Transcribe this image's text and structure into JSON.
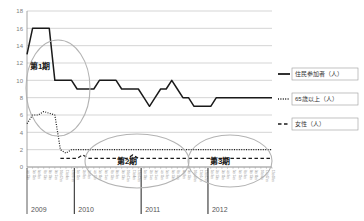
{
  "chart_data": {
    "type": "line",
    "title": "",
    "xlabel": "",
    "ylabel": "",
    "ylim": [
      0,
      18
    ],
    "yticks": [
      0,
      2,
      4,
      6,
      8,
      10,
      12,
      14,
      16,
      18
    ],
    "grid": true,
    "legend_position": "right",
    "year_groups": [
      "2009",
      "2010",
      "2011",
      "2012"
    ],
    "x": [
      "4月13日",
      "5月11日",
      "6月8日",
      "7月13日",
      "8月10日",
      "9月14日",
      "10月12日",
      "11月9日",
      "12月14日",
      "1月11日",
      "2月8日",
      "3月8日",
      "4月12日",
      "5月10日",
      "6月14日",
      "7月12日",
      "8月9日",
      "9月13日",
      "10月11日",
      "11月8日",
      "12月13日",
      "1月10日",
      "2月14日",
      "3月14日",
      "4月11日",
      "5月9日",
      "6月13日",
      "7月11日",
      "8月8日",
      "9月12日",
      "10月10日",
      "11月14日",
      "12月12日",
      "1月9日",
      "2月13日",
      "3月12日",
      "4月9日",
      "5月14日",
      "6月11日",
      "7月9日",
      "8月13日",
      "9月10日",
      "10月8日",
      "11月12日",
      "12月10日"
    ],
    "series": [
      {
        "name": "住民参加者（人）",
        "style": "solid",
        "color": "#1a1a1a",
        "values": [
          13,
          16,
          16,
          16,
          16,
          10,
          10,
          10,
          10,
          9,
          9,
          9,
          9,
          10,
          10,
          10,
          10,
          9,
          9,
          9,
          9,
          8,
          7,
          8,
          9,
          9,
          10,
          9,
          8,
          8,
          7,
          7,
          7,
          7,
          8,
          8,
          8,
          8,
          8,
          8,
          8,
          8,
          8,
          8,
          8
        ]
      },
      {
        "name": "65歳以上（人）",
        "style": "dotted",
        "color": "#1a1a1a",
        "values": [
          5,
          6,
          6,
          6.4,
          6.2,
          6,
          2,
          1.6,
          2,
          2,
          2,
          2,
          2,
          2,
          2,
          2,
          2,
          2,
          2,
          2,
          2,
          2,
          2,
          2,
          2,
          2,
          2,
          2,
          2,
          2,
          2,
          2,
          2,
          2,
          2,
          2,
          2,
          2,
          2,
          2,
          2,
          2,
          2,
          2,
          2
        ]
      },
      {
        "name": "女性（人）",
        "style": "dashed",
        "color": "#1a1a1a",
        "values": [
          null,
          null,
          null,
          null,
          null,
          null,
          1,
          1,
          1,
          1,
          1.4,
          1,
          1,
          1,
          1,
          1,
          1,
          1,
          1,
          1.4,
          1,
          1,
          1,
          1,
          1,
          1,
          1,
          1,
          1,
          1,
          1,
          1,
          1,
          1,
          1,
          1,
          1,
          1,
          1,
          1,
          1,
          1,
          1,
          1,
          1
        ]
      }
    ],
    "annotations": [
      {
        "label": "第1期",
        "shape": "ellipse"
      },
      {
        "label": "第2期",
        "shape": "ellipse"
      },
      {
        "label": "第3期",
        "shape": "ellipse"
      }
    ]
  }
}
